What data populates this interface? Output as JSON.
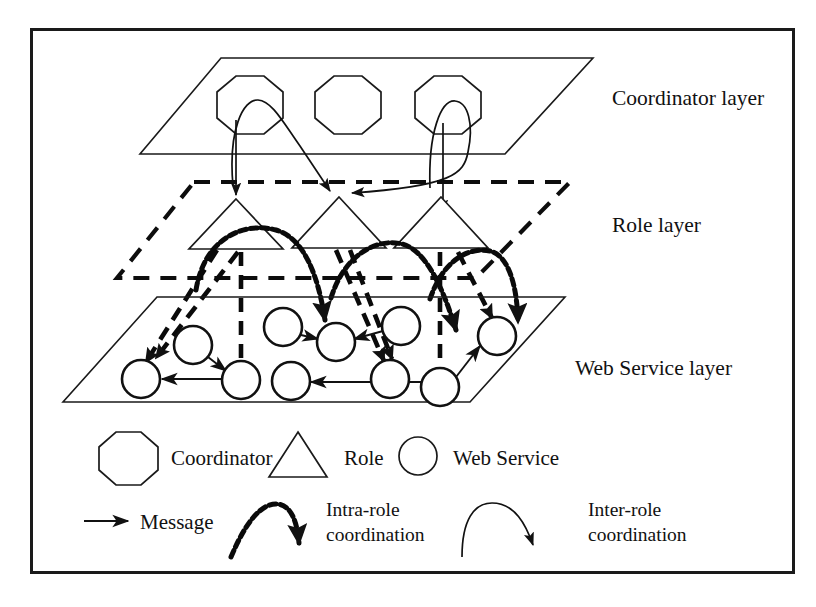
{
  "figure": {
    "border_color": "#1a1a1a",
    "background": "#ffffff"
  },
  "layers": [
    {
      "id": "coordinator",
      "label": "Coordinator layer",
      "style": "solid-parallelogram",
      "label_x": 612,
      "label_y": 105,
      "nodes": [
        {
          "name": "coordinator-1",
          "shape": "octagon",
          "cx": 250,
          "cy": 105,
          "r": 34
        },
        {
          "name": "coordinator-2",
          "shape": "octagon",
          "cx": 348,
          "cy": 105,
          "r": 34
        },
        {
          "name": "coordinator-3",
          "shape": "octagon",
          "cx": 448,
          "cy": 105,
          "r": 34
        }
      ]
    },
    {
      "id": "role",
      "label": "Role layer",
      "style": "dashed-parallelogram",
      "label_x": 612,
      "label_y": 232,
      "nodes": [
        {
          "name": "role-1",
          "shape": "triangle",
          "apex_x": 236,
          "apex_y": 199,
          "half_w": 47,
          "base_y": 249
        },
        {
          "name": "role-2",
          "shape": "triangle",
          "apex_x": 339,
          "apex_y": 197,
          "half_w": 47,
          "base_y": 248
        },
        {
          "name": "role-3",
          "shape": "triangle",
          "apex_x": 441,
          "apex_y": 197,
          "half_w": 47,
          "base_y": 248
        }
      ]
    },
    {
      "id": "web-service",
      "label": "Web Service layer",
      "style": "solid-parallelogram",
      "label_x": 575,
      "label_y": 368,
      "nodes": [
        {
          "name": "web-service-1",
          "shape": "circle",
          "cx": 141,
          "cy": 379,
          "r": 18
        },
        {
          "name": "web-service-2",
          "shape": "circle",
          "cx": 193,
          "cy": 345,
          "r": 18
        },
        {
          "name": "web-service-3",
          "shape": "circle",
          "cx": 241,
          "cy": 380,
          "r": 18
        },
        {
          "name": "web-service-4",
          "shape": "circle",
          "cx": 291,
          "cy": 380,
          "r": 18
        },
        {
          "name": "web-service-5",
          "shape": "circle",
          "cx": 285,
          "cy": 327,
          "r": 18
        },
        {
          "name": "web-service-6",
          "shape": "circle",
          "cx": 335,
          "cy": 342,
          "r": 18
        },
        {
          "name": "web-service-7",
          "shape": "circle",
          "cx": 400,
          "cy": 326,
          "r": 18
        },
        {
          "name": "web-service-8",
          "shape": "circle",
          "cx": 389,
          "cy": 379,
          "r": 18
        },
        {
          "name": "web-service-9",
          "shape": "circle",
          "cx": 440,
          "cy": 386,
          "r": 18
        },
        {
          "name": "web-service-10",
          "shape": "circle",
          "cx": 497,
          "cy": 336,
          "r": 18
        }
      ]
    }
  ],
  "legend": {
    "symbols": [
      {
        "name": "legend-coordinator",
        "shape": "octagon",
        "label": "Coordinator"
      },
      {
        "name": "legend-role",
        "shape": "triangle",
        "label": "Role"
      },
      {
        "name": "legend-web-service",
        "shape": "circle",
        "label": "Web Service"
      }
    ],
    "lines": [
      {
        "name": "legend-message",
        "style": "straight-arrow",
        "label": "Message"
      },
      {
        "name": "legend-intra-role",
        "style": "dotted-curve-arrow",
        "label_line1": "Intra-role",
        "label_line2": "coordination"
      },
      {
        "name": "legend-inter-role",
        "style": "solid-curve-arrow",
        "label_line1": "Inter-role",
        "label_line2": "coordination"
      }
    ]
  },
  "messages": [
    {
      "from": "web-service-2",
      "to": "web-service-3"
    },
    {
      "from": "web-service-3",
      "to": "web-service-1"
    },
    {
      "from": "web-service-5",
      "to": "web-service-6"
    },
    {
      "from": "web-service-7",
      "to": "web-service-6"
    },
    {
      "from": "web-service-9",
      "to": "web-service-4"
    },
    {
      "from": "web-service-9",
      "to": "web-service-10"
    }
  ]
}
